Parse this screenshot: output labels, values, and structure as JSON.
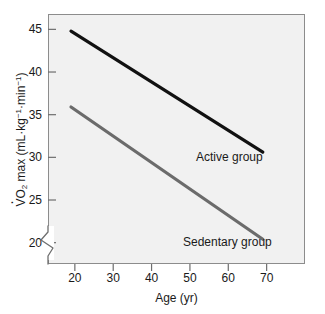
{
  "chart_data": {
    "type": "line",
    "title": "",
    "xlabel": "Age (yr)",
    "ylabel": "V̇O2 max (mL·kg⁻¹·min⁻¹)",
    "ylabel_parts": {
      "prefix": "V",
      "sub": "2",
      "mid": "O",
      "rest": " max (mL·kg",
      "sup1": "−1",
      "mid2": "·min",
      "sup2": "−1",
      "suffix": ")"
    },
    "xlim": [
      13,
      80
    ],
    "ylim": [
      17.5,
      46.8
    ],
    "xticks": [
      20,
      30,
      40,
      50,
      60,
      70
    ],
    "xtick_labels": [
      "20",
      "30",
      "40",
      "50",
      "60",
      "70"
    ],
    "yticks": [
      20,
      25,
      30,
      35,
      40,
      45
    ],
    "ytick_labels": [
      "20",
      "25",
      "30",
      "35",
      "40",
      "45"
    ],
    "grid": false,
    "legend_position": "inline-annotation",
    "axis_break": {
      "axis": "y",
      "present": true,
      "symbol": "zigzag",
      "below_value": 20
    },
    "series": [
      {
        "name": "Active group",
        "color": "#111111",
        "line_width": 3,
        "annotation": "Active group",
        "x": [
          19,
          69
        ],
        "values": [
          44.8,
          30.6
        ]
      },
      {
        "name": "Sedentary group",
        "color": "#6b6b6b",
        "line_width": 3,
        "annotation": "Sedentary group",
        "x": [
          19,
          69
        ],
        "values": [
          35.9,
          20.4
        ]
      }
    ],
    "background_color": "#f1f1f1",
    "frame_color": "#8c8c8c",
    "text_color": "#1a1a1a"
  }
}
